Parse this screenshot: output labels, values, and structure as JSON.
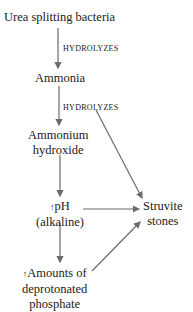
{
  "diagram": {
    "nodes": {
      "urea": "Urea splitting bacteria",
      "ammonia": "Ammonia",
      "ammonium_line1": "Ammonium",
      "ammonium_line2": "hydroxide",
      "ph_arrow": "↑",
      "ph_line1": "pH",
      "ph_line2": "(alkaline)",
      "struvite_line1": "Struvite",
      "struvite_line2": "stones",
      "phosphate_arrow": "↑",
      "phosphate_line1": "Amounts of",
      "phosphate_line2": "deprotonated",
      "phosphate_line3": "phosphate"
    },
    "edge_labels": {
      "urea_to_ammonia": "HYDROLYZES",
      "ammonia_to_struvite": "HYDROLYZES"
    },
    "edges": [
      {
        "from": "Urea splitting bacteria",
        "to": "Ammonia",
        "label": "HYDROLYZES"
      },
      {
        "from": "Ammonia",
        "to": "Ammonium hydroxide"
      },
      {
        "from": "Ammonia",
        "to": "Struvite stones",
        "label": "HYDROLYZES"
      },
      {
        "from": "Ammonium hydroxide",
        "to": "↑pH (alkaline)"
      },
      {
        "from": "↑pH (alkaline)",
        "to": "Struvite stones"
      },
      {
        "from": "↑pH (alkaline)",
        "to": "↑Amounts of deprotonated phosphate"
      },
      {
        "from": "↑Amounts of deprotonated phosphate",
        "to": "Struvite stones"
      }
    ],
    "colors": {
      "arrow": "#6b6b6b",
      "text": "#1a1a1a"
    }
  }
}
